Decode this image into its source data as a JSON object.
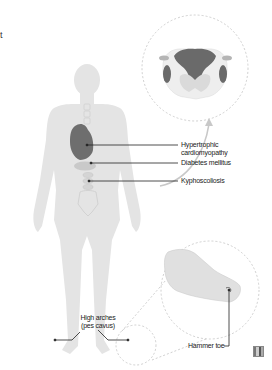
{
  "figure": {
    "partial_text_fragment": "t",
    "labels": {
      "cardiomyopathy": [
        "Hypertrophic",
        "cardiomyopathy"
      ],
      "diabetes": "Diabetes mellitus",
      "kyphoscoliosis": "Kyphoscoliosis",
      "high_arches": [
        "High arches",
        "(pes cavus)"
      ],
      "hammer_toe": "Hammer toe"
    },
    "insets": [
      {
        "name": "spinal-cord-cross-section",
        "description": "Spinal cord cross-section inset"
      },
      {
        "name": "foot-closeup",
        "description": "Foot close-up inset showing hammer toe"
      }
    ],
    "colors": {
      "body": "#e4e4e4",
      "body_outline": "#d0d0d0",
      "heart": "#6e6e6e",
      "organ": "#c9c9c9",
      "spinal_dark": "#6a6a6a",
      "spinal_light": "#d8d8d8",
      "leader_line": "#222222",
      "dashed_circle": "#bdbdbd",
      "arrow": "#c8c8c8"
    }
  }
}
